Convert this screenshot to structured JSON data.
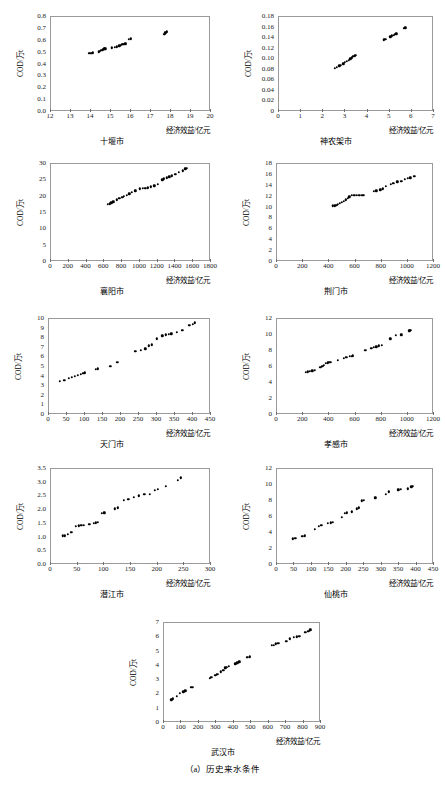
{
  "figure": {
    "caption": "（a）历史来水条件",
    "y_axis_label": "COD/万t",
    "x_axis_label": "经济效益/亿元"
  },
  "chart_data": [
    {
      "type": "scatter",
      "title": "十堰市",
      "xlabel": "经济效益/亿元",
      "ylabel": "COD/万t",
      "xlim": [
        12,
        20
      ],
      "ylim": [
        0,
        0.8
      ],
      "xticks": [
        "12",
        "13",
        "14",
        "15",
        "16",
        "17",
        "18",
        "19",
        "20"
      ],
      "yticks": [
        "0.0",
        "0.1",
        "0.2",
        "0.3",
        "0.4",
        "0.5",
        "0.6",
        "0.7",
        "0.8"
      ],
      "grid": false,
      "points": [
        [
          13.88,
          0.476
        ],
        [
          13.95,
          0.478
        ],
        [
          14.02,
          0.481
        ],
        [
          14.1,
          0.483
        ],
        [
          14.38,
          0.492
        ],
        [
          14.45,
          0.497
        ],
        [
          14.52,
          0.504
        ],
        [
          14.6,
          0.509
        ],
        [
          14.66,
          0.515
        ],
        [
          14.72,
          0.518
        ],
        [
          15.05,
          0.524
        ],
        [
          15.2,
          0.528
        ],
        [
          15.3,
          0.532
        ],
        [
          15.42,
          0.54
        ],
        [
          15.5,
          0.546
        ],
        [
          15.56,
          0.556
        ],
        [
          15.62,
          0.552
        ],
        [
          15.68,
          0.558
        ],
        [
          15.74,
          0.56
        ],
        [
          15.9,
          0.596
        ],
        [
          15.98,
          0.601
        ],
        [
          17.66,
          0.641
        ],
        [
          17.72,
          0.652
        ],
        [
          17.78,
          0.66
        ]
      ]
    },
    {
      "type": "scatter",
      "title": "神农架市",
      "xlabel": "经济效益/亿元",
      "ylabel": "COD/万t",
      "xlim": [
        0,
        7
      ],
      "ylim": [
        0,
        0.18
      ],
      "xticks": [
        "0",
        "1",
        "2",
        "3",
        "4",
        "5",
        "6",
        "7"
      ],
      "yticks": [
        "0",
        "0.02",
        "0.04",
        "0.06",
        "0.08",
        "0.10",
        "0.12",
        "0.14",
        "0.16",
        "0.18"
      ],
      "grid": false,
      "points": [
        [
          2.52,
          0.0795
        ],
        [
          2.62,
          0.0812
        ],
        [
          2.72,
          0.0838
        ],
        [
          2.8,
          0.0852
        ],
        [
          2.9,
          0.0878
        ],
        [
          2.98,
          0.0905
        ],
        [
          3.06,
          0.0928
        ],
        [
          3.14,
          0.0948
        ],
        [
          3.22,
          0.0972
        ],
        [
          3.3,
          0.0995
        ],
        [
          3.36,
          0.1015
        ],
        [
          3.42,
          0.103
        ],
        [
          3.46,
          0.1042
        ],
        [
          4.72,
          0.1335
        ],
        [
          4.8,
          0.1345
        ],
        [
          5.02,
          0.1392
        ],
        [
          5.1,
          0.1408
        ],
        [
          5.18,
          0.1422
        ],
        [
          5.24,
          0.1438
        ],
        [
          5.3,
          0.1448
        ],
        [
          5.64,
          0.1548
        ],
        [
          5.7,
          0.1562
        ]
      ]
    },
    {
      "type": "scatter",
      "title": "襄阳市",
      "xlabel": "经济效益/亿元",
      "ylabel": "COD/万t",
      "xlim": [
        0,
        1800
      ],
      "ylim": [
        0,
        30
      ],
      "xticks": [
        "0",
        "200",
        "400",
        "600",
        "800",
        "1000",
        "1200",
        "1400",
        "1600",
        "1800"
      ],
      "yticks": [
        "0",
        "5",
        "10",
        "15",
        "20",
        "25",
        "30"
      ],
      "grid": false,
      "points": [
        [
          640,
          17.1
        ],
        [
          660,
          17.3
        ],
        [
          680,
          17.6
        ],
        [
          700,
          17.9
        ],
        [
          740,
          18.5
        ],
        [
          770,
          18.9
        ],
        [
          800,
          19.3
        ],
        [
          820,
          19.6
        ],
        [
          850,
          19.9
        ],
        [
          880,
          20.3
        ],
        [
          910,
          20.7
        ],
        [
          950,
          21.2
        ],
        [
          1000,
          21.8
        ],
        [
          1030,
          21.9
        ],
        [
          1060,
          22.0
        ],
        [
          1090,
          22.1
        ],
        [
          1120,
          22.4
        ],
        [
          1160,
          22.8
        ],
        [
          1200,
          23.3
        ],
        [
          1250,
          24.6
        ],
        [
          1270,
          24.9
        ],
        [
          1300,
          25.2
        ],
        [
          1330,
          25.5
        ],
        [
          1360,
          25.8
        ],
        [
          1400,
          26.3
        ],
        [
          1440,
          26.8
        ],
        [
          1480,
          27.4
        ],
        [
          1510,
          27.9
        ],
        [
          1530,
          28.1
        ]
      ]
    },
    {
      "type": "scatter",
      "title": "荆门市",
      "xlabel": "经济效益/亿元",
      "ylabel": "COD/万t",
      "xlim": [
        0,
        1200
      ],
      "ylim": [
        0,
        18
      ],
      "xticks": [
        "0",
        "200",
        "400",
        "600",
        "800",
        "1000",
        "1200"
      ],
      "yticks": [
        "0",
        "2",
        "4",
        "6",
        "8",
        "10",
        "12",
        "14",
        "16",
        "18"
      ],
      "grid": false,
      "points": [
        [
          428,
          9.95
        ],
        [
          440,
          10.0
        ],
        [
          452,
          10.1
        ],
        [
          464,
          10.2
        ],
        [
          480,
          10.4
        ],
        [
          495,
          10.6
        ],
        [
          510,
          10.8
        ],
        [
          525,
          11.1
        ],
        [
          540,
          11.4
        ],
        [
          552,
          11.6
        ],
        [
          570,
          11.85
        ],
        [
          590,
          11.9
        ],
        [
          610,
          11.92
        ],
        [
          630,
          11.95
        ],
        [
          650,
          11.85
        ],
        [
          660,
          11.88
        ],
        [
          740,
          12.65
        ],
        [
          760,
          12.75
        ],
        [
          790,
          12.9
        ],
        [
          810,
          13.1
        ],
        [
          830,
          13.6
        ],
        [
          870,
          13.95
        ],
        [
          890,
          14.1
        ],
        [
          920,
          14.35
        ],
        [
          950,
          14.5
        ],
        [
          975,
          14.9
        ],
        [
          1000,
          15.0
        ],
        [
          1020,
          15.15
        ],
        [
          1050,
          15.4
        ]
      ]
    },
    {
      "type": "scatter",
      "title": "天门市",
      "xlabel": "经济效益/亿元",
      "ylabel": "COD/万t",
      "xlim": [
        0,
        450
      ],
      "ylim": [
        0,
        10
      ],
      "xticks": [
        "0",
        "50",
        "100",
        "150",
        "200",
        "250",
        "300",
        "350",
        "400",
        "450"
      ],
      "yticks": [
        "0",
        "1",
        "2",
        "3",
        "4",
        "5",
        "6",
        "7",
        "8",
        "9",
        "10"
      ],
      "grid": false,
      "points": [
        [
          30,
          3.3
        ],
        [
          42,
          3.45
        ],
        [
          55,
          3.6
        ],
        [
          63,
          3.7
        ],
        [
          72,
          3.85
        ],
        [
          80,
          3.95
        ],
        [
          88,
          4.05
        ],
        [
          95,
          4.15
        ],
        [
          100,
          4.2
        ],
        [
          130,
          4.55
        ],
        [
          135,
          4.6
        ],
        [
          170,
          4.9
        ],
        [
          190,
          5.3
        ],
        [
          240,
          6.45
        ],
        [
          255,
          6.55
        ],
        [
          268,
          6.7
        ],
        [
          278,
          7.0
        ],
        [
          285,
          7.1
        ],
        [
          300,
          7.75
        ],
        [
          315,
          8.05
        ],
        [
          325,
          8.15
        ],
        [
          332,
          8.2
        ],
        [
          340,
          8.25
        ],
        [
          355,
          8.45
        ],
        [
          370,
          8.6
        ],
        [
          390,
          9.15
        ],
        [
          400,
          9.25
        ],
        [
          405,
          9.4
        ]
      ]
    },
    {
      "type": "scatter",
      "title": "孝感市",
      "xlabel": "经济效益/亿元",
      "ylabel": "COD/万t",
      "xlim": [
        0,
        1200
      ],
      "ylim": [
        0,
        12
      ],
      "xticks": [
        "0",
        "200",
        "400",
        "600",
        "800",
        "1000",
        "1200"
      ],
      "yticks": [
        "0",
        "2",
        "4",
        "6",
        "8",
        "10",
        "12"
      ],
      "grid": false,
      "points": [
        [
          220,
          5.1
        ],
        [
          235,
          5.15
        ],
        [
          250,
          5.2
        ],
        [
          270,
          5.3
        ],
        [
          290,
          5.35
        ],
        [
          330,
          5.75
        ],
        [
          345,
          5.85
        ],
        [
          360,
          6.0
        ],
        [
          375,
          6.2
        ],
        [
          390,
          6.3
        ],
        [
          400,
          6.35
        ],
        [
          410,
          6.35
        ],
        [
          465,
          6.6
        ],
        [
          510,
          6.85
        ],
        [
          530,
          6.95
        ],
        [
          555,
          7.1
        ],
        [
          570,
          7.1
        ],
        [
          580,
          7.15
        ],
        [
          675,
          7.85
        ],
        [
          720,
          8.1
        ],
        [
          740,
          8.2
        ],
        [
          760,
          8.3
        ],
        [
          780,
          8.4
        ],
        [
          800,
          8.45
        ],
        [
          865,
          9.3
        ],
        [
          910,
          9.7
        ],
        [
          950,
          9.8
        ],
        [
          1010,
          10.3
        ],
        [
          1020,
          10.35
        ]
      ]
    },
    {
      "type": "scatter",
      "title": "潜江市",
      "xlabel": "经济效益/亿元",
      "ylabel": "COD/万t",
      "xlim": [
        0,
        300
      ],
      "ylim": [
        0,
        3.5
      ],
      "xticks": [
        "0",
        "50",
        "100",
        "150",
        "200",
        "250",
        "300"
      ],
      "yticks": [
        "0.0",
        "0.5",
        "1.0",
        "1.5",
        "2.0",
        "2.5",
        "3.0",
        "3.5"
      ],
      "grid": false,
      "points": [
        [
          22,
          0.99
        ],
        [
          26,
          1.0
        ],
        [
          32,
          1.05
        ],
        [
          38,
          1.12
        ],
        [
          47,
          1.35
        ],
        [
          52,
          1.36
        ],
        [
          57,
          1.37
        ],
        [
          62,
          1.38
        ],
        [
          72,
          1.41
        ],
        [
          80,
          1.45
        ],
        [
          84,
          1.47
        ],
        [
          88,
          1.48
        ],
        [
          95,
          1.81
        ],
        [
          100,
          1.84
        ],
        [
          120,
          1.98
        ],
        [
          125,
          2.02
        ],
        [
          137,
          2.28
        ],
        [
          145,
          2.33
        ],
        [
          155,
          2.4
        ],
        [
          165,
          2.45
        ],
        [
          175,
          2.5
        ],
        [
          185,
          2.52
        ],
        [
          195,
          2.65
        ],
        [
          200,
          2.7
        ],
        [
          215,
          2.8
        ],
        [
          238,
          3.02
        ],
        [
          243,
          3.11
        ]
      ]
    },
    {
      "type": "scatter",
      "title": "仙桃市",
      "xlabel": "经济效益/亿元",
      "ylabel": "COD/万t",
      "xlim": [
        0,
        450
      ],
      "ylim": [
        0,
        12
      ],
      "xticks": [
        "0",
        "50",
        "100",
        "150",
        "200",
        "250",
        "300",
        "350",
        "400",
        "450"
      ],
      "yticks": [
        "0",
        "2",
        "4",
        "6",
        "8",
        "10",
        "12"
      ],
      "grid": false,
      "points": [
        [
          45,
          3.05
        ],
        [
          52,
          3.1
        ],
        [
          72,
          3.35
        ],
        [
          80,
          3.4
        ],
        [
          108,
          4.2
        ],
        [
          120,
          4.6
        ],
        [
          127,
          4.7
        ],
        [
          145,
          4.95
        ],
        [
          155,
          5.05
        ],
        [
          160,
          5.1
        ],
        [
          185,
          5.75
        ],
        [
          195,
          6.2
        ],
        [
          200,
          6.3
        ],
        [
          215,
          6.4
        ],
        [
          228,
          6.8
        ],
        [
          235,
          6.9
        ],
        [
          243,
          7.8
        ],
        [
          248,
          7.85
        ],
        [
          282,
          8.15
        ],
        [
          312,
          8.6
        ],
        [
          320,
          8.9
        ],
        [
          348,
          9.15
        ],
        [
          355,
          9.2
        ],
        [
          375,
          9.3
        ],
        [
          385,
          9.55
        ],
        [
          390,
          9.6
        ]
      ]
    },
    {
      "type": "scatter",
      "title": "武汉市",
      "xlabel": "经济效益/亿元",
      "ylabel": "COD/万t",
      "xlim": [
        0,
        900
      ],
      "ylim": [
        0,
        7
      ],
      "xticks": [
        "0",
        "100",
        "200",
        "300",
        "400",
        "500",
        "600",
        "700",
        "800",
        "900"
      ],
      "yticks": [
        "0",
        "1",
        "2",
        "3",
        "4",
        "5",
        "6",
        "7"
      ],
      "grid": false,
      "points": [
        [
          42,
          1.5
        ],
        [
          50,
          1.55
        ],
        [
          72,
          1.75
        ],
        [
          90,
          1.95
        ],
        [
          110,
          2.05
        ],
        [
          122,
          2.12
        ],
        [
          155,
          2.35
        ],
        [
          162,
          2.38
        ],
        [
          262,
          3.0
        ],
        [
          272,
          3.05
        ],
        [
          295,
          3.2
        ],
        [
          305,
          3.28
        ],
        [
          325,
          3.45
        ],
        [
          340,
          3.55
        ],
        [
          352,
          3.72
        ],
        [
          360,
          3.78
        ],
        [
          372,
          3.82
        ],
        [
          408,
          4.0
        ],
        [
          420,
          4.08
        ],
        [
          432,
          4.15
        ],
        [
          478,
          4.45
        ],
        [
          492,
          4.5
        ],
        [
          618,
          5.3
        ],
        [
          628,
          5.32
        ],
        [
          640,
          5.4
        ],
        [
          655,
          5.45
        ],
        [
          700,
          5.6
        ],
        [
          722,
          5.75
        ],
        [
          745,
          5.85
        ],
        [
          760,
          5.9
        ],
        [
          775,
          5.95
        ],
        [
          810,
          6.2
        ],
        [
          828,
          6.3
        ],
        [
          838,
          6.38
        ]
      ]
    }
  ]
}
